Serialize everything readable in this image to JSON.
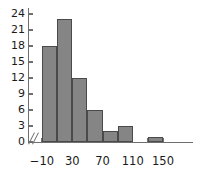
{
  "chart_data": {
    "type": "bar",
    "title": "",
    "subtitle": "",
    "xlabel": "",
    "ylabel": "",
    "categories": [
      "-10 to 10",
      "10 to 30",
      "30 to 50",
      "50 to 70",
      "70 to 90",
      "90 to 110",
      "130 to 150"
    ],
    "bin_edges": [
      -10,
      10,
      30,
      50,
      70,
      90,
      110,
      150
    ],
    "bins": [
      {
        "left": -10,
        "right": 10,
        "value": 18
      },
      {
        "left": 10,
        "right": 30,
        "value": 23
      },
      {
        "left": 30,
        "right": 50,
        "value": 12
      },
      {
        "left": 50,
        "right": 70,
        "value": 6
      },
      {
        "left": 70,
        "right": 90,
        "value": 2
      },
      {
        "left": 90,
        "right": 110,
        "value": 3
      },
      {
        "left": 130,
        "right": 150,
        "value": 1
      }
    ],
    "values": [
      18,
      23,
      12,
      6,
      2,
      3,
      1
    ],
    "xlim": [
      -10,
      150
    ],
    "ylim": [
      0,
      24
    ],
    "y_ticks": [
      0,
      3,
      6,
      9,
      12,
      15,
      18,
      21,
      24
    ],
    "y_tick_labels": [
      "0",
      "3",
      "6",
      "9",
      "12",
      "15",
      "18",
      "21",
      "24"
    ],
    "x_ticks": [
      -10,
      30,
      70,
      110,
      150
    ],
    "x_tick_labels": [
      "−10",
      "30",
      "70",
      "110",
      "150"
    ],
    "x_minor_ticks": [
      -10,
      10,
      30,
      50,
      70,
      90,
      110,
      130,
      150
    ],
    "grid": false,
    "legend": null,
    "axis_break": "x-axis break near origin",
    "colors": {
      "bar_fill": "#858585",
      "bar_edge": "#4a4a4a",
      "axis": "#6f6f6f",
      "text": "#1a1a1a",
      "background": "#ffffff"
    }
  }
}
